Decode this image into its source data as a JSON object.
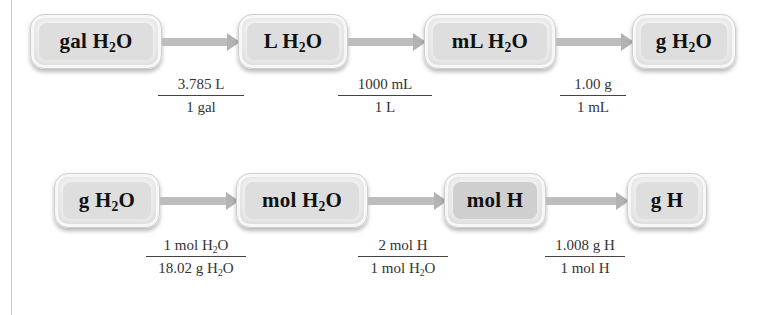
{
  "row1": {
    "boxes": [
      {
        "unit": "gal",
        "species": "H",
        "sub": "2",
        "tail": "O"
      },
      {
        "unit": "L",
        "species": "H",
        "sub": "2",
        "tail": "O"
      },
      {
        "unit": "mL",
        "species": "H",
        "sub": "2",
        "tail": "O"
      },
      {
        "unit": "g",
        "species": "H",
        "sub": "2",
        "tail": "O"
      }
    ],
    "factors": [
      {
        "num": "3.785 L",
        "den": "1 gal"
      },
      {
        "num": "1000 mL",
        "den": "1 L"
      },
      {
        "num": "1.00 g",
        "den": "1 mL"
      }
    ]
  },
  "row2": {
    "boxes": [
      {
        "unit": "g",
        "species": "H",
        "sub": "2",
        "tail": "O"
      },
      {
        "unit": "mol",
        "species": "H",
        "sub": "2",
        "tail": "O"
      },
      {
        "unit": "mol",
        "species": "H",
        "sub": "",
        "tail": ""
      },
      {
        "unit": "g",
        "species": "H",
        "sub": "",
        "tail": ""
      }
    ],
    "factors": [
      {
        "num_pre": "1 mol H",
        "num_sub": "2",
        "num_post": "O",
        "den_pre": "18.02 g H",
        "den_sub": "2",
        "den_post": "O"
      },
      {
        "num_pre": "2 mol H",
        "num_sub": "",
        "num_post": "",
        "den_pre": "1 mol H",
        "den_sub": "2",
        "den_post": "O"
      },
      {
        "num_pre": "1.008 g H",
        "num_sub": "",
        "num_post": "",
        "den_pre": "1 mol H",
        "den_sub": "",
        "den_post": ""
      }
    ]
  },
  "colors": {
    "box_fill": "#dedede",
    "box_border": "#cfcfcf",
    "arrow": "#bdbdbd",
    "text": "#111111"
  }
}
